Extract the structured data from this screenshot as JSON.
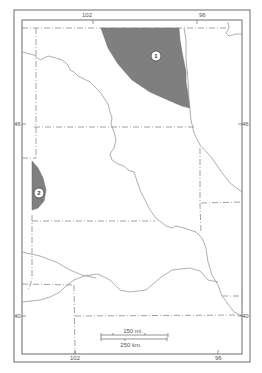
{
  "map": {
    "colors": {
      "frame": "#6b6b6b",
      "border": "#8a8a8a",
      "river": "#9a9a9a",
      "shaded_area": "#7f7f7f",
      "marker_fill": "#ffffff"
    },
    "longitude_labels": {
      "top_left": "102",
      "top_right": "96",
      "bottom_left": "102",
      "bottom_right": "96"
    },
    "latitude_labels": {
      "left_upper": "46",
      "right_upper": "46",
      "left_lower": "40",
      "right_lower": "40"
    },
    "areas": [
      {
        "id": "area-1",
        "label": "1"
      },
      {
        "id": "area-2",
        "label": "2"
      }
    ],
    "scale_bar": {
      "miles_label": "150 mi.",
      "km_label": "250 km."
    }
  }
}
